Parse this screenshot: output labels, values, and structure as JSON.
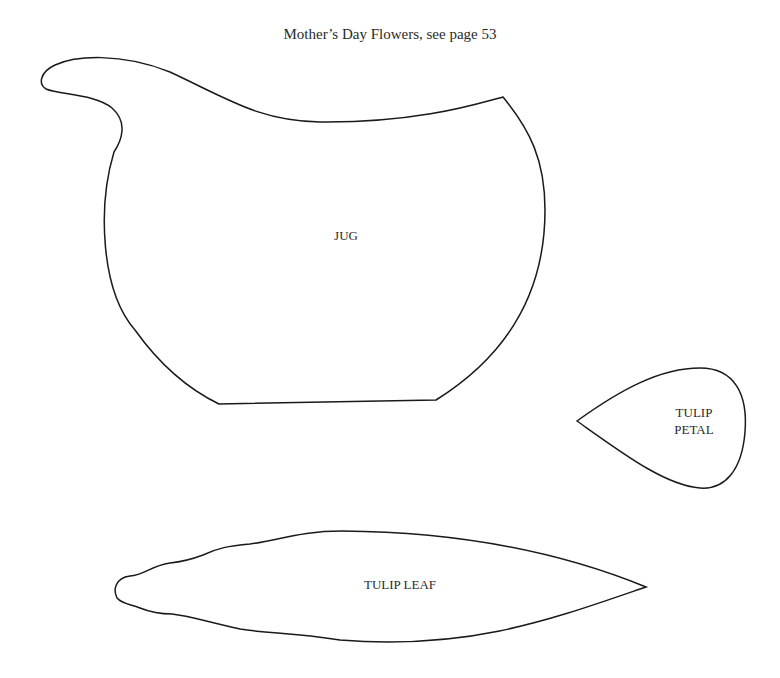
{
  "title": "Mother’s Day Flowers, see page 53",
  "shapes": {
    "jug": {
      "label": "JUG"
    },
    "tulip_petal": {
      "label_line1": "TULIP",
      "label_line2": "PETAL"
    },
    "tulip_leaf": {
      "label": "TULIP LEAF"
    }
  },
  "colors": {
    "outline": "#1a1a1a",
    "background": "#ffffff",
    "text": "#2a2a2a"
  }
}
